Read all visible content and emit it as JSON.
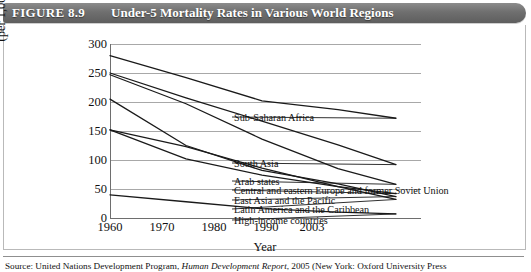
{
  "figure": {
    "number": "FIGURE 8.9",
    "title": "Under-5 Mortality Rates in Various World Regions",
    "source": "Source: United Nations Development Program, Human Development Report, 2005 (New York: Oxford University Press",
    "source_prefix": "Source: United Nations Development Program, ",
    "source_italic": "Human Development Report",
    "source_suffix": ", 2005 (New York: Oxford University Press"
  },
  "chart_data": {
    "type": "line",
    "title": "Under-5 Mortality Rates in Various World Regions",
    "xlabel": "Year",
    "ylabel": "Under-5 mortality rate (per 1,000 live births)",
    "ylabel_line1": "Under-5 mortality rate",
    "ylabel_line2": "(per 1,000 live births)",
    "x": [
      1960,
      1970,
      1980,
      1990,
      2003
    ],
    "xticks": [
      "1960",
      "1970",
      "1980",
      "1990",
      "2003"
    ],
    "yticks": [
      0,
      50,
      100,
      150,
      200,
      250,
      300
    ],
    "ylim": [
      0,
      300
    ],
    "grid": true,
    "legend_position": "inline-right-labels",
    "series": [
      {
        "name": "Sub-Saharan Africa",
        "values": [
          280,
          242,
          202,
          187,
          172
        ]
      },
      {
        "name": "South Asia",
        "values": [
          250,
          207,
          167,
          126,
          92
        ]
      },
      {
        "name": "Arab states",
        "values": [
          247,
          197,
          136,
          85,
          58
        ]
      },
      {
        "name": "Central and eastern Europe and former Soviet Union",
        "values": [
          152,
          102,
          74,
          54,
          42
        ]
      },
      {
        "name": "East Asia and the Pacific",
        "values": [
          205,
          125,
          82,
          59,
          37
        ]
      },
      {
        "name": "Latin America and the Caribbean",
        "values": [
          152,
          123,
          86,
          54,
          32
        ]
      },
      {
        "name": "High-income countries",
        "values": [
          40,
          28,
          16,
          10,
          7
        ]
      }
    ]
  }
}
